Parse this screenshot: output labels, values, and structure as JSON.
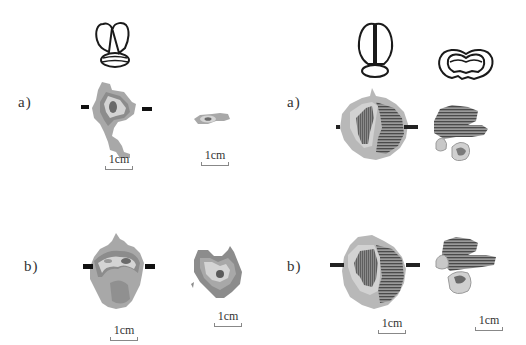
{
  "figure": {
    "left_column": {
      "reference_icon": "brain-dorsal-view-with-cerebellum",
      "rows": [
        {
          "label": "a)",
          "images": [
            {
              "name": "coronal-lesion-map",
              "scale_label": "1cm",
              "marker_bars": true
            },
            {
              "name": "axial-small-lesion-map",
              "scale_label": "1cm",
              "marker_bars": false
            }
          ]
        },
        {
          "label": "b)",
          "images": [
            {
              "name": "coronal-lesion-map",
              "scale_label": "1cm",
              "marker_bars": true
            },
            {
              "name": "axial-lesion-map",
              "scale_label": "1cm",
              "marker_bars": false
            }
          ]
        }
      ]
    },
    "right_column": {
      "reference_icons": [
        "brain-dorsal-view",
        "brain-coronal-section"
      ],
      "rows": [
        {
          "label": "a)",
          "images": [
            {
              "name": "dorsal-lesion-map",
              "scale_label": "",
              "marker_bars": true
            },
            {
              "name": "coronal-lesion-map",
              "scale_label": "",
              "marker_bars": false
            }
          ]
        },
        {
          "label": "b)",
          "images": [
            {
              "name": "dorsal-lesion-map",
              "scale_label": "1cm",
              "marker_bars": true
            },
            {
              "name": "coronal-lesion-map",
              "scale_label": "1cm",
              "marker_bars": false
            }
          ]
        }
      ]
    },
    "colors": {
      "outer_gray": "#a8a8a8",
      "light_gray": "#d4d4d4",
      "mid_gray": "#8c8c8c",
      "dark_gray": "#5a5a5a",
      "hatch": "#4a4a4a",
      "marker": "#111111",
      "outline": "#1a1a1a"
    }
  }
}
